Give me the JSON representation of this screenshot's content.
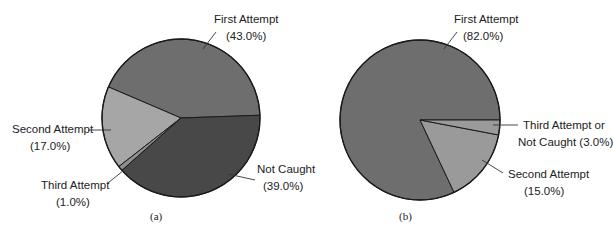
{
  "chart_data": [
    {
      "type": "pie",
      "title": "",
      "caption": "(a)",
      "categories": [
        "First Attempt",
        "Second Attempt",
        "Third Attempt",
        "Not Caught"
      ],
      "values": [
        43.0,
        17.0,
        1.0,
        39.0
      ],
      "value_labels": [
        "(43.0%)",
        "(17.0%)",
        "(1.0%)",
        "(39.0%)"
      ],
      "colors": [
        "#6e6e6e",
        "#a6a6a6",
        "#8e8e8e",
        "#484848"
      ],
      "start_angle_deg": 2,
      "direction": "counterclockwise",
      "legend": "none (callout labels)"
    },
    {
      "type": "pie",
      "title": "",
      "caption": "(b)",
      "categories": [
        "First Attempt",
        "Second Attempt",
        "Third Attempt or Not Caught"
      ],
      "values": [
        82.0,
        15.0,
        3.0
      ],
      "value_labels": [
        "(82.0%)",
        "(15.0%)",
        "(3.0%)"
      ],
      "colors": [
        "#6e6e6e",
        "#9a9a9a",
        "#9a9a9a"
      ],
      "start_angle_deg": 0,
      "direction": "counterclockwise",
      "legend": "none (callout labels)"
    }
  ],
  "labels": {
    "a": {
      "first_name": "First Attempt",
      "first_pct": "(43.0%)",
      "second_name": "Second Attempt",
      "second_pct": "(17.0%)",
      "third_name": "Third Attempt",
      "third_pct": "(1.0%)",
      "notcaught_name": "Not Caught",
      "notcaught_pct": "(39.0%)",
      "caption": "(a)"
    },
    "b": {
      "first_name": "First Attempt",
      "first_pct": "(82.0%)",
      "third_line1": "Third Attempt or",
      "third_line2": "Not Caught (3.0%)",
      "second_name": "Second Attempt",
      "second_pct": "(15.0%)",
      "caption": "(b)"
    }
  }
}
